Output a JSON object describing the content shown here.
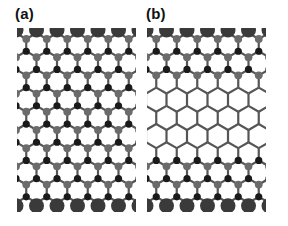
{
  "figure": {
    "panels": [
      {
        "id": "a",
        "label": "(a)",
        "description": "Zigzag-edged honeycomb nanoribbon, atoms decorated throughout",
        "x0": 17,
        "x1": 136,
        "bare_rows": []
      },
      {
        "id": "b",
        "label": "(b)",
        "description": "Zigzag-edged honeycomb nanoribbon with bare (undecorated) hexagonal core",
        "x0": 147,
        "x1": 266,
        "bare_rows": [
          3,
          4,
          5,
          6
        ]
      }
    ],
    "lattice": {
      "hex_width": 20.5,
      "row_spacing": 18.2,
      "top_y": 36,
      "rows": 10,
      "bond_color": "#555555",
      "bond_width": 2.2
    },
    "atom_colors": {
      "large_edge": "#3a3a3a",
      "grey": "#6b6b6b",
      "black": "#1a1a1a"
    }
  }
}
